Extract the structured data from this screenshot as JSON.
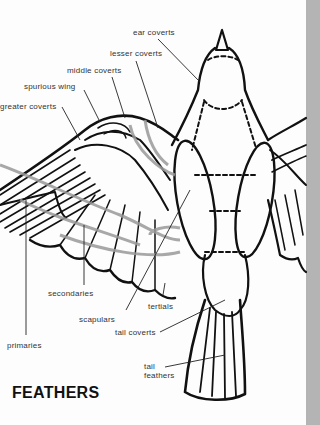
{
  "title": "FEATHERS",
  "labels": {
    "ear_coverts": "ear coverts",
    "lesser_coverts": "lesser coverts",
    "middle_coverts": "middle coverts",
    "spurious_wing": "spurious wing",
    "greater_coverts": "greater coverts",
    "secondaries": "secondaries",
    "tertials": "tertials",
    "scapulars": "scapulars",
    "tail_coverts": "tail coverts",
    "primaries": "primaries",
    "tail_line1": "tail",
    "tail_line2": "feathers"
  },
  "colors": {
    "ink": "#111111",
    "arrow": "#9a9a9a",
    "page_edge": "#b4b4b4"
  }
}
